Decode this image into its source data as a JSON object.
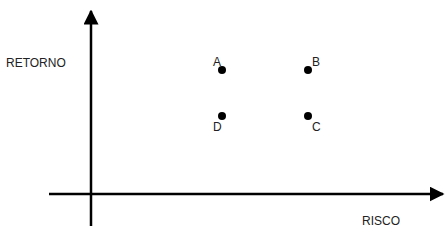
{
  "diagram": {
    "type": "risk-return-quadrant",
    "y_axis_label": "RETORNO",
    "x_axis_label": "RISCO",
    "color": "#000000",
    "points": [
      {
        "label": "A",
        "risk": "low",
        "return": "high"
      },
      {
        "label": "B",
        "risk": "high",
        "return": "high"
      },
      {
        "label": "C",
        "risk": "high",
        "return": "low"
      },
      {
        "label": "D",
        "risk": "low",
        "return": "low"
      }
    ]
  }
}
